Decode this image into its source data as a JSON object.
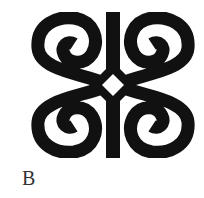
{
  "figure": {
    "symbol_name": "dwennimmen-symbol",
    "label": "B",
    "colors": {
      "ink": "#111111",
      "background": "#ffffff",
      "label": "#333333"
    }
  }
}
